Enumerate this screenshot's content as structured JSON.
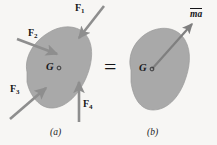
{
  "figure": {
    "background_color": "#f7f6f4",
    "body_fill_color": "#a9a9a9",
    "body_stroke_color": "#8c8c8c",
    "arrow_color": "#8e8e8e",
    "text_color": "#17171a",
    "equals_sign": "=",
    "panels": [
      {
        "id": "panel-a",
        "caption": "(a)",
        "center_label": "G",
        "forces": [
          {
            "name": "F1",
            "label": "F",
            "subscript": "1",
            "direction": "down-left",
            "description": "arrow pointing down-left into body from upper right"
          },
          {
            "name": "F2",
            "label": "F",
            "subscript": "2",
            "direction": "down-right",
            "description": "arrow pointing down-right into body from upper left"
          },
          {
            "name": "F3",
            "label": "F",
            "subscript": "3",
            "direction": "up-right",
            "description": "arrow pointing up-right into body from lower left"
          },
          {
            "name": "F4",
            "label": "F",
            "subscript": "4",
            "direction": "up",
            "description": "arrow pointing straight up into body from below"
          }
        ]
      },
      {
        "id": "panel-b",
        "caption": "(b)",
        "center_label": "G",
        "resultant": {
          "name": "ma",
          "label": "ma",
          "direction": "up-right",
          "description": "resultant vector m-a drawn from center of mass G toward upper right"
        }
      }
    ]
  }
}
